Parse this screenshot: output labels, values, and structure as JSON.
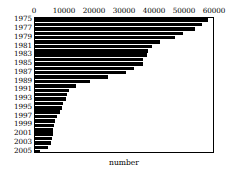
{
  "chart_data": {
    "type": "bar",
    "orientation": "horizontal",
    "title": "",
    "xlabel": "number",
    "ylabel": "",
    "xlim": [
      0,
      60000
    ],
    "xticks": [
      0,
      10000,
      20000,
      30000,
      40000,
      50000,
      60000
    ],
    "xtick_labels": [
      "0",
      "10000",
      "20000",
      "30000",
      "40000",
      "50000",
      "60000"
    ],
    "grid": false,
    "legend": false,
    "bar_color": "#000000",
    "categories": [
      "1975",
      "1976",
      "1977",
      "1978",
      "1979",
      "1980",
      "1981",
      "1982",
      "1983",
      "1984",
      "1985",
      "1986",
      "1987",
      "1988",
      "1989",
      "1990",
      "1991",
      "1992",
      "1993",
      "1994",
      "1995",
      "1996",
      "1997",
      "1998",
      "1999",
      "2000",
      "2001",
      "2002",
      "2003",
      "2004",
      "2005"
    ],
    "ytick_labels": [
      "1975",
      "",
      "1977",
      "",
      "1979",
      "",
      "1981",
      "",
      "1983",
      "",
      "1985",
      "",
      "1987",
      "",
      "1989",
      "",
      "1991",
      "",
      "1993",
      "",
      "1995",
      "",
      "1997",
      "",
      "1999",
      "",
      "2001",
      "",
      "2003",
      "",
      "2005"
    ],
    "values": [
      57700,
      55500,
      53200,
      49300,
      46700,
      41600,
      39000,
      37800,
      37400,
      36100,
      35900,
      33100,
      30300,
      24400,
      18300,
      13700,
      11400,
      10600,
      10300,
      9400,
      9000,
      8300,
      7300,
      6700,
      6300,
      6100,
      5900,
      5700,
      5400,
      4200,
      1500
    ]
  }
}
